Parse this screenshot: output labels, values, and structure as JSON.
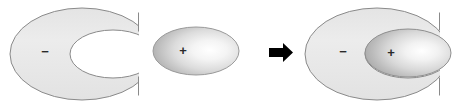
{
  "figure": {
    "background_color": "#ffffff",
    "width": 474,
    "height": 105,
    "outline_color": "#808080",
    "shape_fill_light": "#eaeaea",
    "shape_fill_mid": "#c9c9c9",
    "shape_fill_dark": "#a8a8a8",
    "shape_highlight": "#fdfdfd",
    "arrow_color": "#000000"
  },
  "panels": {
    "left": {
      "name": "crescent-negative",
      "charge_label": "−",
      "charge_label_x": 45,
      "charge_label_y": 51
    },
    "middle": {
      "name": "ellipse-positive",
      "charge_label": "+",
      "charge_label_x": 183,
      "charge_label_y": 50
    },
    "arrow": {
      "name": "arrow-right",
      "glyph": "→"
    },
    "right": {
      "name": "combined-crescent-ellipse",
      "charge_label_negative": "−",
      "charge_label_negative_x": 343,
      "charge_label_negative_y": 51,
      "charge_label_positive": "+",
      "charge_label_positive_x": 391,
      "charge_label_positive_y": 52
    }
  }
}
